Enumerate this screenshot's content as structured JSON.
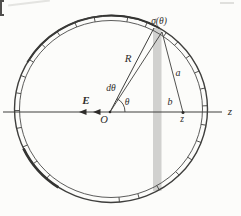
{
  "diagram": {
    "type": "physics-figure",
    "labels": {
      "sigma": "σ(θ)",
      "R": "R",
      "d_theta": "dθ",
      "theta": "θ",
      "E": "E",
      "O": "O",
      "a": "a",
      "b": "b",
      "z_axis": "z",
      "z_point": "z"
    },
    "colors": {
      "background": "#fcfcfa",
      "line": "#3e3e3c",
      "strip_fill": "#c9c9c7",
      "text": "#2e2c2a"
    },
    "geometry": {
      "center": {
        "x": 111,
        "y": 109
      },
      "outer_rx": 96.5,
      "outer_ry": 93.5,
      "inner_rx": 91.5,
      "inner_ry": 88.5,
      "theta_deg": 62,
      "tick_angles_deg": [
        -85,
        -73,
        -60,
        -45,
        -33,
        -21,
        -10,
        2,
        13,
        24,
        35,
        46,
        55,
        68,
        80,
        100,
        112,
        124,
        136,
        148,
        159,
        170,
        181,
        192,
        204,
        216,
        228
      ]
    }
  }
}
